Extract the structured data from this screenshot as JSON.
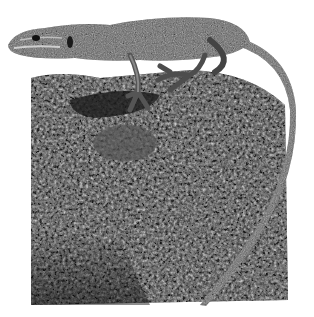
{
  "image": {
    "subject": "lizard on lichen-covered rock",
    "style": "black-and-white photograph",
    "background_color": "#ffffff",
    "rock_tone": "#4a4a4a",
    "lizard_tone": "#6e6e6e"
  }
}
